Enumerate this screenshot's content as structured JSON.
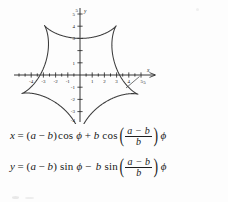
{
  "figure": {
    "name": "hypocycloid-plot",
    "axis_labels": {
      "x": "x",
      "y": "y"
    },
    "x_ticks": [
      "-4",
      "-3",
      "-2",
      "-1",
      "1",
      "2",
      "3",
      "4",
      "5"
    ],
    "y_ticks": [
      "5",
      "4",
      "3",
      "1",
      "-1",
      "-2",
      "-3",
      "-4"
    ],
    "x_axis_end_label": "5",
    "y_axis_top_label": "5",
    "curve_color": "#3a3a3a",
    "axis_color": "#1f1f1f"
  },
  "chart_data": {
    "type": "line",
    "title": "",
    "xlabel": "x",
    "ylabel": "y",
    "xlim": [
      -5,
      5
    ],
    "ylim": [
      -5,
      5
    ],
    "grid": false,
    "legend": "none",
    "curve": "hypocycloid with 5 cusps (a = 5, b = 1)",
    "parameters": {
      "a": 5,
      "b": 1,
      "cusps": 5
    },
    "cusp_points": [
      [
        5.0,
        0.0
      ],
      [
        1.55,
        4.76
      ],
      [
        -4.05,
        2.94
      ],
      [
        -4.05,
        -2.94
      ],
      [
        1.55,
        -4.76
      ]
    ],
    "x_ticks": [
      -4,
      -3,
      -2,
      -1,
      1,
      2,
      3,
      4,
      5
    ],
    "y_ticks": [
      5,
      4,
      3,
      1,
      -1,
      -2,
      -3,
      -4
    ]
  },
  "equations": {
    "eq1": {
      "lhs": "x",
      "equals": "=",
      "open": "(",
      "a": "a",
      "minus": "−",
      "b": "b",
      "close": ")",
      "fn": "cos",
      "phi1": "ϕ",
      "plus": "+",
      "b2": "b",
      "fn2": "cos",
      "paren_open": "(",
      "num": "a − b",
      "den": "b",
      "paren_close": ")",
      "phi2": "ϕ"
    },
    "eq2": {
      "lhs": "y",
      "equals": "=",
      "open": "(",
      "a": "a",
      "minus": "−",
      "b": "b",
      "close": ")",
      "fn": "sin",
      "phi1": "ϕ",
      "minus2": "−",
      "b2": "b",
      "fn2": "sin",
      "paren_open": "(",
      "num": "a − b",
      "den": "b",
      "paren_close": ")",
      "phi2": "ϕ"
    }
  }
}
